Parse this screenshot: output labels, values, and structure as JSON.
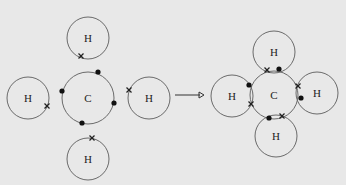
{
  "diagram": {
    "background": "#e8e8e8",
    "before": {
      "carbon": {
        "label": "C",
        "cx": 88,
        "cy": 98,
        "r": 26,
        "electrons": [
          [
            98,
            72
          ],
          [
            62,
            91
          ],
          [
            114,
            103
          ],
          [
            82,
            123
          ]
        ]
      },
      "hydrogens": [
        {
          "id": "top",
          "label": "H",
          "cx": 88,
          "cy": 38,
          "r": 21,
          "electron": [
            81,
            56
          ]
        },
        {
          "id": "left",
          "label": "H",
          "cx": 28,
          "cy": 98,
          "r": 21,
          "electron": [
            47,
            106
          ]
        },
        {
          "id": "right",
          "label": "H",
          "cx": 149,
          "cy": 98,
          "r": 21,
          "electron": [
            129,
            90
          ]
        },
        {
          "id": "bottom",
          "label": "H",
          "cx": 88,
          "cy": 159,
          "r": 21,
          "electron": [
            92,
            138
          ]
        }
      ]
    },
    "arrow": {
      "x1": 175,
      "y1": 95,
      "x2": 204,
      "y2": 95
    },
    "after": {
      "carbon": {
        "label": "C",
        "cx": 274,
        "cy": 95,
        "r": 24
      },
      "hydrogens": [
        {
          "id": "top",
          "label": "H",
          "cx": 274,
          "cy": 52,
          "r": 21
        },
        {
          "id": "left",
          "label": "H",
          "cx": 232,
          "cy": 96,
          "r": 21
        },
        {
          "id": "right",
          "label": "H",
          "cx": 317,
          "cy": 93,
          "r": 21
        },
        {
          "id": "bottom",
          "label": "H",
          "cx": 276,
          "cy": 136,
          "r": 21
        }
      ],
      "dots": [
        [
          279,
          69
        ],
        [
          249,
          85
        ],
        [
          301,
          98
        ],
        [
          269,
          118
        ]
      ],
      "crosses": [
        [
          267,
          70
        ],
        [
          251,
          104
        ],
        [
          298,
          86
        ],
        [
          282,
          116
        ]
      ]
    }
  }
}
